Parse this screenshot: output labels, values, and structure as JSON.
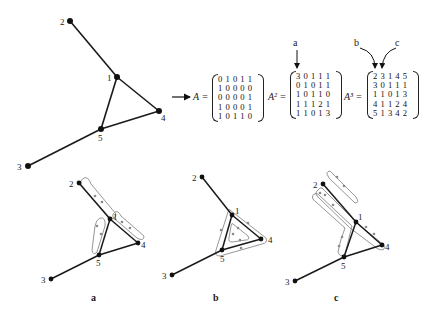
{
  "colors": {
    "edge": "#1a1a1a",
    "node": "#111111",
    "walk_loop": "#8a8a8a",
    "background": "#ffffff"
  },
  "graph": {
    "nodes": [
      "1",
      "2",
      "3",
      "4",
      "5"
    ],
    "edges": [
      [
        "1",
        "2"
      ],
      [
        "1",
        "4"
      ],
      [
        "1",
        "5"
      ],
      [
        "3",
        "5"
      ],
      [
        "4",
        "5"
      ]
    ]
  },
  "top_graph": {
    "positions": {
      "1": [
        117,
        77
      ],
      "2": [
        70,
        21
      ],
      "3": [
        28,
        166
      ],
      "4": [
        159,
        111
      ],
      "5": [
        101,
        129
      ]
    }
  },
  "matrices": {
    "A": {
      "name": "A =",
      "rows": [
        "0 1 0 1 1",
        "1 0 0 0 0",
        "0 0 0 0 1",
        "1 0 0 0 1",
        "1 0 1 1 0"
      ]
    },
    "A2": {
      "name": "A² =",
      "rows": [
        "3 0 1 1 1",
        "0 1 0 1 1",
        "1 0 1 1 0",
        "1 1 1 2 1",
        "1 1 0 1 3"
      ],
      "annotation": "a"
    },
    "A3": {
      "name": "A³ =",
      "rows": [
        "2 3 1 4 5",
        "3 0 1 1 1",
        "1 1 0 1 3",
        "4 1 1 2 4",
        "5 1 3 4 2"
      ],
      "annotations": [
        "b",
        "c"
      ]
    }
  },
  "panels": [
    {
      "label": "a",
      "description": "Closed walks of length 2 from node 1 (A²[1][1] = 3)",
      "positions": {
        "1": [
          110,
          219
        ],
        "2": [
          79,
          183
        ],
        "3": [
          51,
          279
        ],
        "4": [
          138,
          243
        ],
        "5": [
          99,
          255
        ]
      }
    },
    {
      "label": "b",
      "description": "Closed walks of length 3 from node 1 (A³[1][1] = 2)",
      "positions": {
        "1": [
          232,
          215
        ],
        "2": [
          202,
          177
        ],
        "3": [
          172,
          275
        ],
        "4": [
          261,
          239
        ],
        "5": [
          222,
          250
        ]
      }
    },
    {
      "label": "c",
      "description": "Walks of length 3 from node 1 to node 2 (A³[1][2] = 3)",
      "positions": {
        "1": [
          356,
          222
        ],
        "2": [
          323,
          184
        ],
        "3": [
          295,
          281
        ],
        "4": [
          382,
          245
        ],
        "5": [
          344,
          257
        ]
      }
    }
  ]
}
